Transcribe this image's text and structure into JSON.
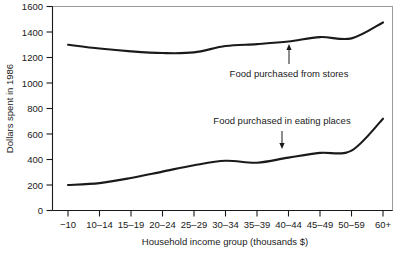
{
  "chart_data": {
    "type": "line",
    "title": "",
    "xlabel": "Household income group (thousands $)",
    "ylabel": "Dollars spent in 1986",
    "categories": [
      "−10",
      "10–14",
      "15–19",
      "20–24",
      "25–29",
      "30–34",
      "35–39",
      "40–44",
      "45–49",
      "50–59",
      "60+"
    ],
    "ylim": [
      0,
      1600
    ],
    "yticks": [
      0,
      200,
      400,
      600,
      800,
      1000,
      1200,
      1400,
      1600
    ],
    "ytick_labels": [
      "0",
      "200",
      "400",
      "600",
      "800",
      "1000",
      "1200",
      "1400",
      "1600"
    ],
    "grid": false,
    "legend_position": "inline-annotation",
    "series": [
      {
        "name": "Food purchased from stores",
        "values": [
          1300,
          1270,
          1248,
          1235,
          1240,
          1290,
          1305,
          1325,
          1360,
          1350,
          1475
        ]
      },
      {
        "name": "Food purchased in eating places",
        "values": [
          200,
          215,
          255,
          305,
          355,
          390,
          375,
          415,
          452,
          470,
          720
        ]
      }
    ],
    "annotations": [
      {
        "text": "Food purchased from stores",
        "arrow": "up",
        "points_to_series": "Food purchased from stores"
      },
      {
        "text": "Food purchased in eating places",
        "arrow": "down",
        "points_to_series": "Food purchased in eating places"
      }
    ]
  },
  "axes": {
    "y_title": "Dollars spent in 1986",
    "x_title": "Household income group (thousands $)",
    "y_labels": [
      "1600",
      "1400",
      "1200",
      "1000",
      "800",
      "600",
      "400",
      "200",
      "0"
    ],
    "x_labels": [
      "−10",
      "10–14",
      "15–19",
      "20–24",
      "25–29",
      "30–34",
      "35–39",
      "40–44",
      "45–49",
      "50–59",
      "60+"
    ]
  },
  "annotations": {
    "upper_label": "Food purchased from stores",
    "lower_label": "Food purchased in eating places",
    "up_arrow_glyph": "up-arrow",
    "down_arrow_glyph": "down-arrow"
  },
  "colors": {
    "line": "#1a1a1a",
    "frame": "#9a9a9a",
    "background": "#ffffff"
  }
}
